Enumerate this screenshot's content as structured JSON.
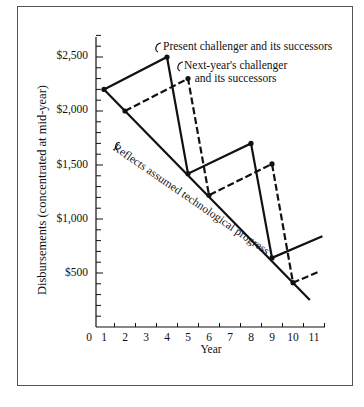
{
  "chart_data": {
    "type": "line",
    "title": "",
    "xlabel": "Year",
    "ylabel": "Disbursements (concentrated at mid-year)",
    "x_ticks": [
      "0",
      "1",
      "2",
      "3",
      "4",
      "5",
      "6",
      "7",
      "8",
      "9",
      "10",
      "11"
    ],
    "y_ticks": [
      "$500",
      "$1,000",
      "$1,500",
      "$2,000",
      "$2,500"
    ],
    "xlim": [
      0,
      11.6
    ],
    "ylim": [
      0,
      2700
    ],
    "grid": false,
    "series": [
      {
        "name": "Present challenger and its successors",
        "style": "solid",
        "points": [
          [
            1,
            2200
          ],
          [
            4,
            2500
          ],
          [
            5,
            1420
          ],
          [
            8,
            1700
          ],
          [
            9,
            640
          ],
          [
            11.4,
            840
          ]
        ]
      },
      {
        "name": "Next-year's challenger and its successors",
        "style": "dashed",
        "points": [
          [
            2,
            2000
          ],
          [
            5,
            2300
          ],
          [
            6,
            1220
          ],
          [
            9,
            1510
          ],
          [
            10,
            410
          ],
          [
            11.2,
            510
          ]
        ]
      },
      {
        "name": "Reflects assumed technological progress",
        "style": "solid",
        "points": [
          [
            1,
            2200
          ],
          [
            10.8,
            250
          ]
        ]
      }
    ],
    "annotations": [
      "Present challenger and its successors",
      "Next-year's challenger and its successors",
      "Reflects assumed technological progress"
    ]
  },
  "labels": {
    "ylabel": "Disbursements (concentrated at mid-year)",
    "xlabel": "Year",
    "ann_present": "Present challenger and its successors",
    "ann_next_1": "Next-year's challenger",
    "ann_next_2": "and its successors",
    "ann_tech": "Reflects assumed technological progress",
    "y": [
      "$2,500",
      "$2,000",
      "$1,500",
      "$1,000",
      "$500"
    ],
    "x": [
      "0",
      "1",
      "2",
      "3",
      "4",
      "5",
      "6",
      "7",
      "8",
      "9",
      "10",
      "11"
    ]
  }
}
